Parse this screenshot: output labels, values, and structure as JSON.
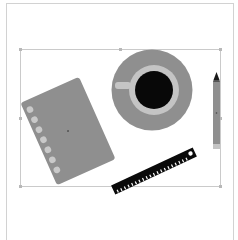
{
  "canvas": {
    "width": 238,
    "height": 240,
    "background": "#ffffff"
  },
  "artboard": {
    "stroke": "#cfcfcf"
  },
  "selection": {
    "stroke": "#c8c8c8",
    "handle": "#b0b0b0"
  },
  "colors": {
    "object_gray": "#8f8f8f",
    "light_gray": "#c4c4c4",
    "black": "#0a0a0a",
    "white": "#ffffff"
  },
  "objects": [
    {
      "name": "notebook",
      "rings": 7
    },
    {
      "name": "coffee-cup-on-saucer"
    },
    {
      "name": "pencil"
    },
    {
      "name": "ruler",
      "ticks": 22
    }
  ]
}
